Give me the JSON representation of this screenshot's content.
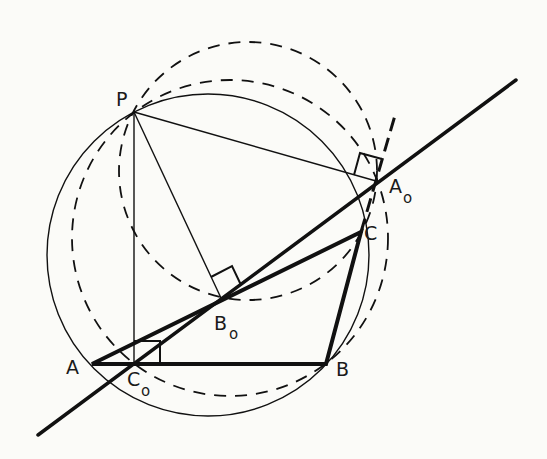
{
  "figure": {
    "points": {
      "P": {
        "label": "P",
        "sub": ""
      },
      "A": {
        "label": "A",
        "sub": ""
      },
      "B": {
        "label": "B",
        "sub": ""
      },
      "C": {
        "label": "C",
        "sub": ""
      },
      "A0": {
        "label": "A",
        "sub": "o"
      },
      "B0": {
        "label": "B",
        "sub": "o"
      },
      "C0": {
        "label": "C",
        "sub": "o"
      }
    },
    "elements": [
      "triangle ABC (bold)",
      "circumcircle through P, A, B, C (thin solid)",
      "circle with diameter PC (dashed)",
      "circle with diameter PB (dashed)",
      "Simson line through A0, B0, C0 (bold)",
      "perpendiculars PA0, PB0, PC0 with right-angle marks",
      "extension of BC beyond C (bold dashed)"
    ],
    "colors": {
      "ink": "#111111",
      "background": "#fbfbf8"
    }
  }
}
